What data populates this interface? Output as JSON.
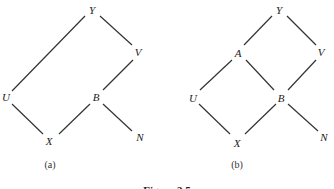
{
  "diagrams": [
    {
      "label": "(a)",
      "nodes": {
        "Y": "Y",
        "V": "V",
        "U": "U",
        "B": "B",
        "X": "X",
        "N": "N"
      },
      "edges": [
        [
          "Y",
          "V"
        ],
        [
          "Y",
          "U"
        ],
        [
          "V",
          "B"
        ],
        [
          "U",
          "X"
        ],
        [
          "B",
          "X"
        ],
        [
          "B",
          "N"
        ]
      ]
    },
    {
      "label": "(b)",
      "nodes": {
        "Y": "Y",
        "A": "A",
        "V": "V",
        "U": "U",
        "B": "B",
        "X": "X",
        "N": "N"
      },
      "edges": [
        [
          "Y",
          "A"
        ],
        [
          "Y",
          "V"
        ],
        [
          "A",
          "U"
        ],
        [
          "A",
          "B"
        ],
        [
          "V",
          "B"
        ],
        [
          "U",
          "X"
        ],
        [
          "B",
          "X"
        ],
        [
          "B",
          "N"
        ]
      ]
    }
  ],
  "caption": "Figure 3.5"
}
